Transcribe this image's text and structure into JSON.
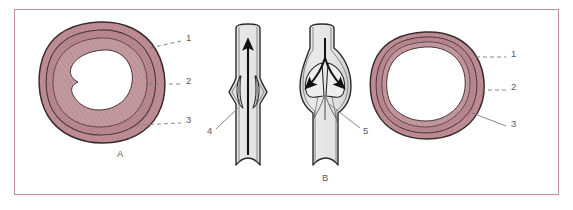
{
  "figure": {
    "background_color": "#ffffff",
    "frame_color": "#c08e93"
  },
  "palette": {
    "wall_outer": "#c4929a",
    "wall_mid": "#bb868f",
    "wall_inner": "#cfa3aa",
    "wall_stroke": "#3a2b2c",
    "striation": "#8e6068",
    "lumen": "#ffffff",
    "vessel_fill": "#e3e3e3",
    "vessel_stroke": "#2b2b2b",
    "arrow_color": "#111111",
    "leader_color": "#7a7a7a",
    "label_color": "#5a5a5a"
  },
  "labels": [
    {
      "id": "label-1-left",
      "text": "1",
      "x": 186,
      "y": 38,
      "leader": {
        "type": "dashed",
        "x1": 150,
        "y1": 48,
        "x2": 181,
        "y2": 41
      }
    },
    {
      "id": "label-2-left",
      "text": "2",
      "x": 186,
      "y": 81,
      "leader": {
        "type": "dashed",
        "x1": 148,
        "y1": 84,
        "x2": 181,
        "y2": 84
      }
    },
    {
      "id": "label-3-left",
      "text": "3",
      "x": 186,
      "y": 120,
      "leader": {
        "type": "dashed",
        "x1": 136,
        "y1": 125,
        "x2": 181,
        "y2": 123
      }
    },
    {
      "id": "label-4",
      "text": "4",
      "x": 209,
      "y": 131,
      "leader": {
        "type": "solid",
        "x1": 216,
        "y1": 129,
        "x2": 238,
        "y2": 108
      }
    },
    {
      "id": "label-5",
      "text": "5",
      "x": 363,
      "y": 131,
      "leader": {
        "type": "solid",
        "x1": 360,
        "y1": 128,
        "x2": 329,
        "y2": 104
      }
    },
    {
      "id": "label-1-right",
      "text": "1",
      "x": 511,
      "y": 54,
      "leader": {
        "type": "dashed",
        "x1": 476,
        "y1": 57,
        "x2": 506,
        "y2": 57
      }
    },
    {
      "id": "label-2-right",
      "text": "2",
      "x": 511,
      "y": 87,
      "leader": {
        "type": "dashed",
        "x1": 481,
        "y1": 90,
        "x2": 506,
        "y2": 90
      }
    },
    {
      "id": "label-3-right",
      "text": "3",
      "x": 511,
      "y": 124,
      "leader": {
        "type": "solid",
        "x1": 472,
        "y1": 113,
        "x2": 506,
        "y2": 126
      }
    }
  ],
  "captions": [
    {
      "id": "caption-a",
      "text": "A",
      "x": 117,
      "y": 154
    },
    {
      "id": "caption-b",
      "text": "B",
      "x": 322,
      "y": 178
    }
  ],
  "panels": {
    "artery": {
      "name": "artery-cross-section",
      "caption": "A",
      "lumen_shape": "irregular-small",
      "wall_thickness": "thick"
    },
    "vein": {
      "name": "vein-cross-section",
      "caption": "B",
      "lumen_shape": "round-large",
      "wall_thickness": "thin"
    },
    "valve_open": {
      "name": "vein-valve-open",
      "flow_direction": "upward",
      "valve_state": "open"
    },
    "valve_closed": {
      "name": "vein-valve-closed",
      "flow_direction": "backflow-diverging",
      "valve_state": "closed"
    }
  }
}
